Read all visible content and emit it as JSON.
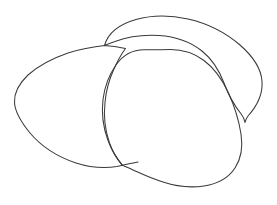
{
  "document": {
    "title": "Line Drawing",
    "kind": "line-drawing",
    "description": "Three overlapping hand-drawn closed oval outlines resembling stones or beans",
    "width": 277,
    "height": 205
  },
  "canvas": {
    "background_color": "#ffffff",
    "stroke_color": "#3a3a3a",
    "stroke_width": 1.05,
    "fill": "none"
  },
  "shapes": [
    {
      "id": "shape-back-upper-right",
      "name": "back-oval-outline",
      "label": "Upper right oval",
      "z_order": 1,
      "stroke_color": "#3a3a3a",
      "fill": "none",
      "path": "M 104.5 45.5 C 108 33 120 24 136 19.5 C 152 15 170 15 188 19 C 208 23.5 226 33 240 45 C 252 55.5 261 68 262 81 C 263 93 257 106 248 116 C 246.5 118 245.5 120 245 122.5 C 244.5 119.5 243.5 117 241.5 114.5 C 234 105 228 94 224 83 C 219 70 212 59 202 51 C 190 41.5 175 36.5 159 35.5 C 143 34.5 127 37 115 41.5 C 110 43.2 107 44.4 104.5 45.5 Z"
    },
    {
      "id": "shape-left",
      "name": "left-oval-outline",
      "label": "Left oval",
      "z_order": 2,
      "stroke_color": "#3a3a3a",
      "fill": "none",
      "path": "M 104.5 45.5 C 92 47 80 49 68 53 C 52 58.5 38 66 28 75 C 19 83.5 14 93 14.5 102.5 C 15 112 21 122 30 133 C 41 146 58 157 76 163 C 90 167.5 105 168.5 117 166.5 C 119.5 166 121 165.7 122.5 165.3 C 117 159 112.5 151.5 109.5 143 C 105 130 103.5 116 105 102.5 C 106 91 109 80 113.5 70 C 117 62 121 54.5 125.5 48.5 C 118 46.8 111 45.8 104.5 45.5 Z"
    },
    {
      "id": "shape-front",
      "name": "front-oval-outline",
      "label": "Front oval",
      "z_order": 3,
      "stroke_color": "#3a3a3a",
      "fill": "none",
      "path": "M 122.5 165.3 C 116 158 111 149 107.5 139 C 103 126.5 101.5 112.5 103 99.5 C 104.5 87 109 75 116 65 C 123 55 133 49.5 145 49.8 C 153 50 161 49.6 170 49.5 C 182 49.4 194 53 204 60.5 C 214 68 222 79 228 92 C 234.5 106 239 121 241 134 C 243 147 241 159 235 168 C 228.5 178 217 184 204 186 C 190 188 175 186 163 182 C 150 178 140 173 132 169.5 C 128.5 168 125.5 166.5 122.5 165.3 Z"
    }
  ],
  "strokes": [
    {
      "id": "stroke-left-shape-bottom-extension",
      "name": "left-oval-bottom-tail",
      "path": "M 122.5 165.3 C 128 164 133 163 138 162"
    }
  ]
}
